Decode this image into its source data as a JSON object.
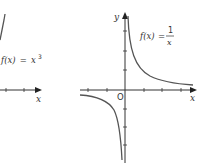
{
  "figure": {
    "left_graph": {
      "function_label": "f(x) = x³",
      "function_label_parts": {
        "lhs": "f(x)",
        "eq": "=",
        "base": "x",
        "exp": "3"
      },
      "x_axis_label": "x",
      "curve_color": "#555555"
    },
    "right_graph": {
      "function_label": "f(x) = 1/x",
      "function_label_parts": {
        "lhs": "f(x)",
        "eq": "=",
        "numerator": "1",
        "denominator": "x"
      },
      "x_axis_label": "x",
      "y_axis_label": "y",
      "origin_label": "O",
      "curve_color": "#555555"
    },
    "axis_color": "#333333"
  }
}
